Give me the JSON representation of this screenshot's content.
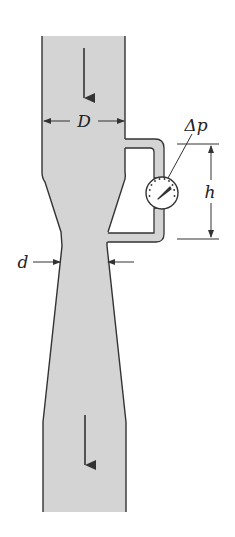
{
  "diagram": {
    "labels": {
      "pipe_diameter": "D",
      "throat_diameter": "d",
      "pressure_difference": "Δp",
      "height": "h"
    },
    "colors": {
      "fluid_fill": "#d4d4d4",
      "outline": "#333333",
      "background": "#ffffff"
    },
    "components": [
      "inlet-pipe",
      "converging-section",
      "throat",
      "diverging-section",
      "outlet-pipe",
      "pressure-tap-tubes",
      "pressure-gauge",
      "flow-arrow-top",
      "flow-arrow-bottom"
    ]
  }
}
